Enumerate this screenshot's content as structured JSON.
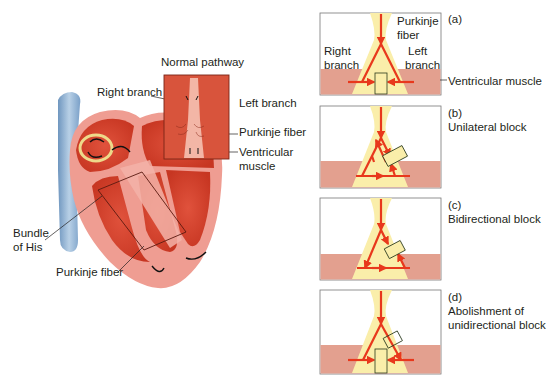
{
  "figure": {
    "heart": {
      "inset_title": "Normal pathway",
      "labels": {
        "right_branch": "Right branch",
        "left_branch": "Left branch",
        "purkinje_fiber_inset": "Purkinje fiber",
        "ventricular_muscle_line1": "Ventricular",
        "ventricular_muscle_line2": "muscle",
        "bundle_of_his_line1": "Bundle",
        "bundle_of_his_line2": "of His",
        "purkinje_fiber_main": "Purkinje fiber"
      }
    },
    "panels": [
      {
        "id": "a",
        "letter": "(a)",
        "caption": "",
        "inner_labels": {
          "purkinje_line1": "Purkinje",
          "purkinje_line2": "fiber",
          "right_line1": "Right",
          "right_line2": "branch",
          "left_line1": "Left",
          "left_line2": "branch"
        },
        "side_label": "Ventricular muscle"
      },
      {
        "id": "b",
        "letter": "(b)",
        "caption": "Unilateral block"
      },
      {
        "id": "c",
        "letter": "(c)",
        "caption": "Bidirectional block"
      },
      {
        "id": "d",
        "letter": "(d)",
        "caption_line1": "Abolishment of",
        "caption_line2": "unidirectional block"
      }
    ],
    "colors": {
      "myocardium": "#d9432f",
      "myocardium_light": "#f0a195",
      "muscle_band": "#e3a08f",
      "purkinje_yellow": "#faeeaa",
      "arrow_red": "#e8381c",
      "block_outline": "#2b3a1d",
      "vessel_blue": "#8fb3d4"
    }
  }
}
